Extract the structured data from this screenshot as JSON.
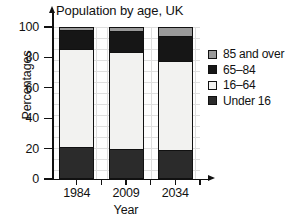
{
  "chart_data": {
    "type": "bar",
    "subtype": "stacked-bar-percentage",
    "title": "Population by age, UK",
    "xlabel": "Year",
    "ylabel": "Percentages",
    "categories": [
      "1984",
      "2009",
      "2034"
    ],
    "ylim": [
      0,
      100
    ],
    "yticks": [
      0,
      20,
      40,
      60,
      80,
      100
    ],
    "grid": true,
    "legend_position": "right",
    "series": [
      {
        "name": "Under 16",
        "color": "#2b2b2b",
        "values": [
          21,
          19,
          19
        ]
      },
      {
        "name": "16–64",
        "color": "#f2f2f0",
        "values": [
          65,
          65,
          59
        ]
      },
      {
        "name": "65–84",
        "color": "#161616",
        "values": [
          13,
          14,
          17
        ]
      },
      {
        "name": "85 and over",
        "color": "#9a9a9a",
        "values": [
          1,
          2,
          5
        ]
      }
    ],
    "legend_order": [
      "85 and over",
      "65–84",
      "16–64",
      "Under 16"
    ]
  },
  "colors": {
    "axis": "#111111",
    "grid": "#d9d9d9",
    "background": "#ffffff",
    "under16": "#2b2b2b",
    "age16_64": "#f2f2f0",
    "age65_84": "#161616",
    "age85_over": "#9a9a9a"
  },
  "axis": {
    "y_tick_labels": [
      "100",
      "80",
      "60",
      "40",
      "20",
      "0"
    ],
    "x_tick_labels": [
      "1984",
      "2009",
      "2034"
    ]
  },
  "legend": {
    "items": [
      {
        "label": "85 and over"
      },
      {
        "label": "65–84"
      },
      {
        "label": "16–64"
      },
      {
        "label": "Under 16"
      }
    ]
  }
}
